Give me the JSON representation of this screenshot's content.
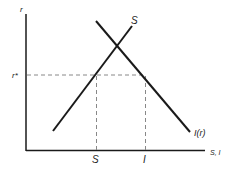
{
  "diagram": {
    "type": "economics-supply-demand",
    "y_axis_label": "r",
    "x_axis_label": "S, I",
    "equilibrium_rate_label": "r*",
    "saving_curve_label": "S",
    "investment_curve_label": "I(r)",
    "saving_tick_label": "S",
    "investment_tick_label": "I"
  },
  "colors": {
    "line": "#1a1a1a",
    "dashed": "#888888",
    "background": "#ffffff"
  }
}
